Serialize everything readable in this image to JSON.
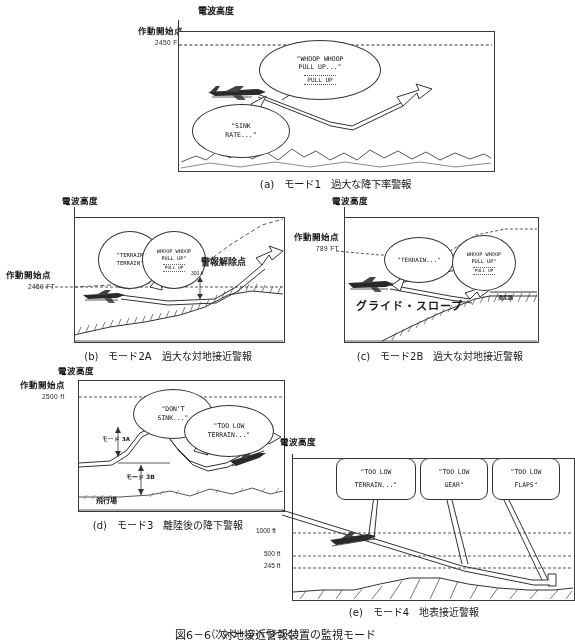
{
  "figure": {
    "number": "図6－6",
    "title": "対地接近警報装置の監視モード",
    "continuation": "（次ページへつづく）"
  },
  "common_labels": {
    "radio_altitude": "電波高度",
    "activation_point": "作動開始点",
    "alert_cancel_point": "警報解除点",
    "glide_slope": "グライド・スロープ",
    "runway": "滑走路",
    "airfield": "飛行場",
    "mode3a": "モード 3A",
    "mode3b": "モード 3B"
  },
  "panels": [
    {
      "id": "a",
      "caption": "(a)　モード1　過大な降下率警報",
      "axis_title": "電波高度",
      "activation_label": "作動開始点",
      "activation_value": "2450 FT",
      "callouts": [
        {
          "name": "sink-rate",
          "lines": [
            "\"SINK",
            "RATE...\""
          ]
        },
        {
          "name": "whoop-pull-up",
          "lines": [
            "\"WHOOP WHOOP",
            "PULL UP...\""
          ],
          "indicator": "PULL UP"
        }
      ]
    },
    {
      "id": "b",
      "caption": "(b)　モード2A　過大な対地接近警報",
      "axis_title": "電波高度",
      "activation_label": "作動開始点",
      "activation_value": "2450 FT",
      "cancel_label": "警報解除点",
      "cancel_value": "300 ft",
      "callouts": [
        {
          "name": "terrain",
          "lines": [
            "\"TERRAIN",
            "TERRAIN\""
          ]
        },
        {
          "name": "whoop-pull-up",
          "lines": [
            "WHOOP WHOOP",
            "PULL UP\""
          ],
          "indicator": "PULL UP"
        }
      ]
    },
    {
      "id": "c",
      "caption": "(c)　モード2B　過大な対地接近警報",
      "axis_title": "電波高度",
      "activation_label": "作動開始点",
      "activation_value": "789 FT",
      "glide_slope": "グライド・スロープ",
      "runway": "滑走路",
      "callouts": [
        {
          "name": "terrain",
          "lines": [
            "\"TERRAIN...\""
          ]
        },
        {
          "name": "whoop-pull-up",
          "lines": [
            "WHOOP WHOOP",
            "PULL UP\""
          ],
          "indicator": "PULL UP"
        }
      ]
    },
    {
      "id": "d",
      "caption": "(d)　モード3　離陸後の降下警報",
      "axis_title": "電波高度",
      "activation_label": "作動開始点",
      "activation_value": "2500 ft",
      "mode3a": "モード 3A",
      "mode3b": "モード 3B",
      "airfield": "飛行場",
      "callouts": [
        {
          "name": "dont-sink",
          "lines": [
            "\"DON'T",
            "SINK...\""
          ]
        },
        {
          "name": "too-low-terrain",
          "lines": [
            "\"TOO LOW",
            "TERRAIN...\""
          ]
        }
      ]
    },
    {
      "id": "e",
      "caption": "(e)　モード4　地表接近警報",
      "axis_title": "電波高度",
      "ticks": [
        "1000 ft",
        "500 ft",
        "245 ft"
      ],
      "callouts": [
        {
          "name": "too-low-terrain",
          "lines": [
            "\"TOO LOW",
            "TERRAIN...\""
          ]
        },
        {
          "name": "too-low-gear",
          "lines": [
            "\"TOO LOW",
            "GEAR\""
          ]
        },
        {
          "name": "too-low-flaps",
          "lines": [
            "\"TOO LOW",
            "FLAPS\""
          ]
        }
      ]
    }
  ]
}
